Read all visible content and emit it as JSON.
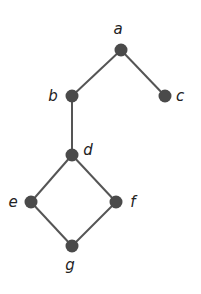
{
  "diagram": {
    "type": "hasse-diagram",
    "nodes": [
      {
        "id": "a",
        "label": "a",
        "x": 121,
        "y": 50,
        "lx": 118,
        "ly": 34
      },
      {
        "id": "b",
        "label": "b",
        "x": 72,
        "y": 96,
        "lx": 53,
        "ly": 101
      },
      {
        "id": "c",
        "label": "c",
        "x": 165,
        "y": 96,
        "lx": 180,
        "ly": 101
      },
      {
        "id": "d",
        "label": "d",
        "x": 72,
        "y": 155,
        "lx": 88,
        "ly": 155
      },
      {
        "id": "e",
        "label": "e",
        "x": 31,
        "y": 202,
        "lx": 13,
        "ly": 207
      },
      {
        "id": "f",
        "label": "f",
        "x": 116,
        "y": 202,
        "lx": 133,
        "ly": 207
      },
      {
        "id": "g",
        "label": "g",
        "x": 72,
        "y": 246,
        "lx": 70,
        "ly": 270
      }
    ],
    "edges": [
      [
        "a",
        "b"
      ],
      [
        "a",
        "c"
      ],
      [
        "b",
        "d"
      ],
      [
        "d",
        "e"
      ],
      [
        "d",
        "f"
      ],
      [
        "e",
        "g"
      ],
      [
        "f",
        "g"
      ]
    ],
    "colors": {
      "node": "#4a4a4a",
      "edge": "#555555",
      "label": "#222222"
    }
  }
}
